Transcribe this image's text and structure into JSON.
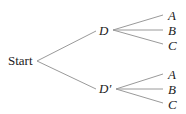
{
  "diagram": {
    "type": "tree",
    "root": {
      "label": "Start"
    },
    "level1": [
      {
        "label": "D",
        "children": [
          "A",
          "B",
          "C"
        ]
      },
      {
        "label": "D'",
        "children": [
          "A",
          "B",
          "C"
        ]
      }
    ]
  },
  "labels": {
    "start": "Start",
    "d": "D",
    "d_prime": "D′",
    "d_children": [
      "A",
      "B",
      "C"
    ],
    "dprime_children": [
      "A",
      "B",
      "C"
    ]
  },
  "colors": {
    "line": "#9a9a9a",
    "text": "#222222",
    "background": "#ffffff"
  }
}
